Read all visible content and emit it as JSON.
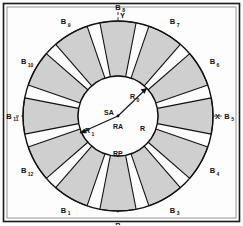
{
  "figure": {
    "background_color": "#fdfdfd",
    "frame_color": "#1a1a1a",
    "sector_fill": "#cfcfcf",
    "line_color": "#111111",
    "axis_style": "dashed"
  },
  "axes": {
    "x_label": "X",
    "y_label": "Y"
  },
  "center_labels": {
    "stator_axis": "SA",
    "rotor_axis": "RA",
    "rotor_pole": "RP",
    "radius": "R"
  },
  "radius_arrows": [
    {
      "base": "R",
      "sub": "0"
    },
    {
      "base": "R",
      "sub": "1"
    }
  ],
  "sectors": {
    "count": 12,
    "labels": [
      {
        "base": "B",
        "sub": "1"
      },
      {
        "base": "B",
        "sub": "2"
      },
      {
        "base": "B",
        "sub": "3"
      },
      {
        "base": "B",
        "sub": "4"
      },
      {
        "base": "B",
        "sub": "5"
      },
      {
        "base": "B",
        "sub": "6"
      },
      {
        "base": "B",
        "sub": "7"
      },
      {
        "base": "B",
        "sub": "8"
      },
      {
        "base": "B",
        "sub": "9"
      },
      {
        "base": "B",
        "sub": "10"
      },
      {
        "base": "B",
        "sub": "11"
      },
      {
        "base": "B",
        "sub": "12"
      }
    ]
  },
  "geometry": {
    "center_x": 118,
    "center_y": 116,
    "outer_radius": 95,
    "inner_radius": 40,
    "sector_gap_degrees": 8
  }
}
